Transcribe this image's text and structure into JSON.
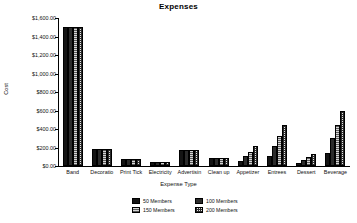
{
  "chart_data": {
    "type": "bar",
    "title": "Expenses",
    "xlabel": "Expense Type",
    "ylabel": "Cost",
    "ylim": [
      0,
      1600
    ],
    "ytick_step": 200,
    "ytick_labels": [
      "$0.00",
      "$200.00",
      "$400.00",
      "$600.00",
      "$800.00",
      "$1,000.00",
      "$1,200.00",
      "$1,400.00",
      "$1,600.00"
    ],
    "ytick_values": [
      0,
      200,
      400,
      600,
      800,
      1000,
      1200,
      1400,
      1600
    ],
    "grid": false,
    "legend_position": "bottom",
    "categories": [
      "Band",
      "Decoratio",
      "Print Tick",
      "Electricity",
      "Advertisin",
      "Clean up",
      "Appetizer",
      "Entrees",
      "Dessert",
      "Beverage"
    ],
    "series": [
      {
        "name": "50 Members",
        "pattern": "solid-black",
        "values": [
          1500,
          185,
          75,
          45,
          175,
          85,
          50,
          105,
          35,
          145
        ]
      },
      {
        "name": "100 Members",
        "pattern": "solid-dark",
        "values": [
          1500,
          185,
          75,
          45,
          175,
          85,
          105,
          215,
          70,
          300
        ]
      },
      {
        "name": "150 Members",
        "pattern": "light-hatch",
        "values": [
          1500,
          185,
          75,
          45,
          175,
          85,
          155,
          325,
          100,
          440
        ]
      },
      {
        "name": "200 Members",
        "pattern": "checker",
        "values": [
          1500,
          185,
          75,
          45,
          175,
          85,
          215,
          440,
          130,
          595
        ]
      }
    ]
  }
}
